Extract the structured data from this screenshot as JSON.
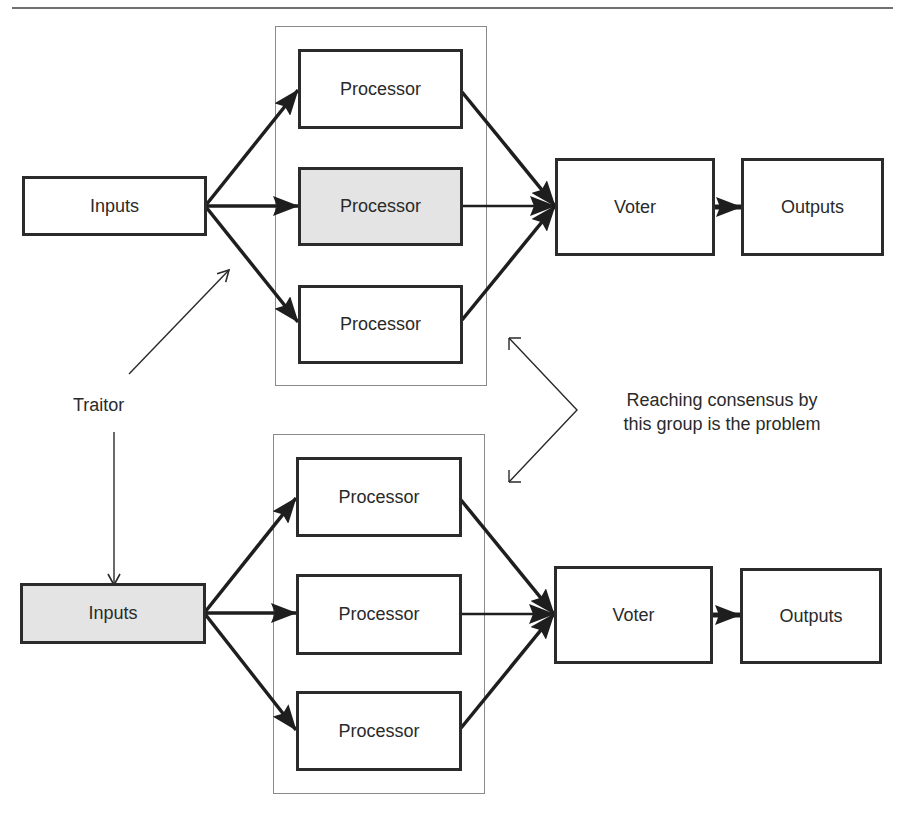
{
  "colors": {
    "stroke": "#2b2b2b",
    "highlight_fill": "#e4e4e4",
    "frame": "#8a8a8a",
    "background": "#ffffff"
  },
  "top_system": {
    "inputs": {
      "label": "Inputs",
      "highlighted": false
    },
    "processors": [
      {
        "label": "Processor",
        "highlighted": false
      },
      {
        "label": "Processor",
        "highlighted": true
      },
      {
        "label": "Processor",
        "highlighted": false
      }
    ],
    "voter": {
      "label": "Voter"
    },
    "outputs": {
      "label": "Outputs"
    }
  },
  "bottom_system": {
    "inputs": {
      "label": "Inputs",
      "highlighted": true
    },
    "processors": [
      {
        "label": "Processor",
        "highlighted": false
      },
      {
        "label": "Processor",
        "highlighted": false
      },
      {
        "label": "Processor",
        "highlighted": false
      }
    ],
    "voter": {
      "label": "Voter"
    },
    "outputs": {
      "label": "Outputs"
    }
  },
  "annotations": {
    "traitor": "Traitor",
    "consensus_line1": "Reaching consensus by",
    "consensus_line2": "this group is the problem"
  }
}
